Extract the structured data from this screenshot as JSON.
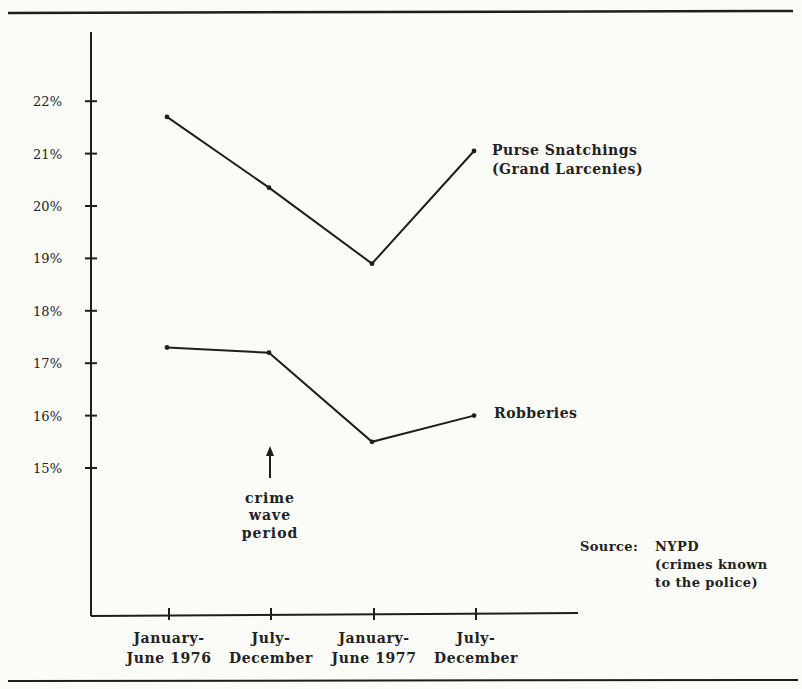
{
  "chart_data": {
    "type": "line",
    "title": "",
    "xlabel": "",
    "ylabel": "",
    "ylim": [
      15,
      22
    ],
    "grid": false,
    "y_ticks": [
      "22%",
      "21%",
      "20%",
      "19%",
      "18%",
      "17%",
      "16%",
      "15%"
    ],
    "categories": [
      [
        "January-",
        "June 1976"
      ],
      [
        "July-",
        "December"
      ],
      [
        "January-",
        "June 1977"
      ],
      [
        "July-",
        "December"
      ]
    ],
    "series": [
      {
        "name": "Purse Snatchings (Grand Larcenies)",
        "label_lines": [
          "Purse Snatchings",
          "(Grand Larcenies)"
        ],
        "values": [
          21.7,
          20.35,
          18.9,
          21.05
        ]
      },
      {
        "name": "Robberies",
        "label_lines": [
          "Robberies"
        ],
        "values": [
          17.3,
          17.2,
          15.5,
          16.0
        ]
      }
    ],
    "annotations": [
      {
        "text_lines": [
          "crime",
          "wave",
          "period"
        ],
        "points_to": "July-December 1976",
        "marker": "up-arrow"
      }
    ],
    "source_lines": [
      "Source:",
      "NYPD",
      "(crimes known",
      "to the police)"
    ],
    "line_color": "#1e1e1e",
    "background": "#fbfbf7"
  }
}
